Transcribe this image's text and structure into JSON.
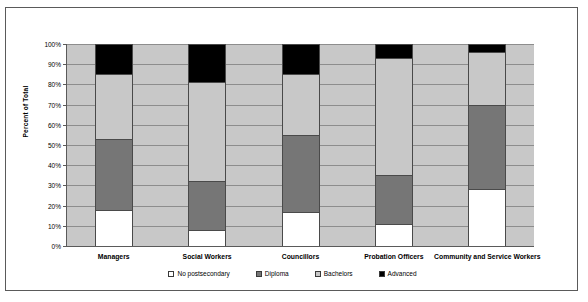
{
  "chart_data": {
    "type": "bar",
    "subtype": "stacked-percent",
    "title": "",
    "xlabel": "",
    "ylabel": "Percent of Total",
    "ylim": [
      0,
      100
    ],
    "grid": true,
    "legend_position": "bottom",
    "categories": [
      "Managers",
      "Social Workers",
      "Councillors",
      "Probation Officers",
      "Community and Service Workers"
    ],
    "tick_labels": [
      "0%",
      "10%",
      "20%",
      "30%",
      "40%",
      "50%",
      "60%",
      "70%",
      "80%",
      "90%",
      "100%"
    ],
    "tick_values": [
      0,
      10,
      20,
      30,
      40,
      50,
      60,
      70,
      80,
      90,
      100
    ],
    "series": [
      {
        "name": "No postsecondary",
        "color": "#ffffff",
        "values": [
          18,
          8,
          17,
          11,
          28
        ]
      },
      {
        "name": "Diploma",
        "color": "#767676",
        "values": [
          35,
          24,
          38,
          24,
          42
        ]
      },
      {
        "name": "Bachelors",
        "color": "#c8c8c8",
        "values": [
          32,
          49,
          30,
          58,
          26
        ]
      },
      {
        "name": "Advanced",
        "color": "#000000",
        "values": [
          15,
          19,
          15,
          7,
          4
        ]
      }
    ],
    "cumulative_tops": [
      [
        18,
        53,
        85,
        100
      ],
      [
        8,
        32,
        81,
        100
      ],
      [
        17,
        55,
        85,
        100
      ],
      [
        11,
        35,
        93,
        100
      ],
      [
        28,
        70,
        96,
        100
      ]
    ],
    "plot_background_color": "#c8c8c8",
    "frame_color": "#5a5a5a",
    "gridline_color": "#8d8d8d"
  },
  "legend": {
    "entries": [
      {
        "label": "No postsecondary",
        "color": "#ffffff"
      },
      {
        "label": "Diploma",
        "color": "#767676"
      },
      {
        "label": "Bachelors",
        "color": "#c8c8c8"
      },
      {
        "label": "Advanced",
        "color": "#000000"
      }
    ]
  }
}
